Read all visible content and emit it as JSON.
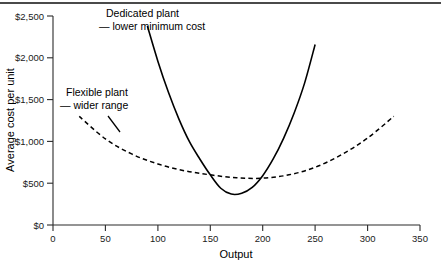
{
  "chart_data": {
    "type": "line",
    "title": "",
    "xlabel": "Output",
    "ylabel": "Average cost per unit",
    "xlim": [
      0,
      350
    ],
    "ylim": [
      0,
      2500
    ],
    "grid": false,
    "legend_position": "none",
    "x_ticks": [
      "0",
      "50",
      "100",
      "150",
      "200",
      "250",
      "300",
      "350"
    ],
    "y_ticks": [
      "$0",
      "$500",
      "$1,000",
      "$1,500",
      "$2,000",
      "$2,500"
    ],
    "annotations": [
      {
        "name": "dedicated-plant-annotation",
        "line1": "Dedicated plant",
        "line2": "— lower minimum cost"
      },
      {
        "name": "flexible-plant-annotation",
        "line1": "Flexible plant",
        "line2": "— wider range"
      }
    ],
    "series": [
      {
        "name": "Dedicated plant",
        "style": "solid",
        "color": "#000000",
        "label": "Dedicated plant — lower minimum cost",
        "minimum_cost": 370,
        "minimum_output": 170,
        "x": [
          90,
          100,
          110,
          120,
          130,
          140,
          150,
          160,
          170,
          180,
          190,
          200,
          210,
          220,
          230,
          240,
          250
        ],
        "y": [
          2380,
          1960,
          1590,
          1270,
          1000,
          790,
          600,
          440,
          370,
          380,
          450,
          590,
          790,
          1040,
          1340,
          1700,
          2160
        ]
      },
      {
        "name": "Flexible plant",
        "style": "dashed",
        "color": "#000000",
        "label": "Flexible plant — wider range",
        "minimum_cost": 560,
        "minimum_output": 185,
        "x": [
          25,
          50,
          75,
          100,
          125,
          150,
          175,
          200,
          225,
          250,
          275,
          300,
          325
        ],
        "y": [
          1300,
          1030,
          850,
          730,
          650,
          600,
          565,
          560,
          600,
          690,
          840,
          1040,
          1300
        ]
      }
    ]
  }
}
